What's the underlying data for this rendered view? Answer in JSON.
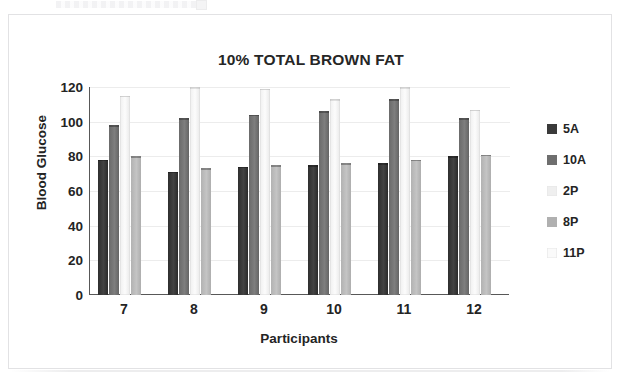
{
  "figure": {
    "title": "10% TOTAL BROWN FAT"
  },
  "axes": {
    "y_title": "Blood Glucose",
    "x_title": "Participants",
    "y_ticks": [
      "120",
      "100",
      "80",
      "60",
      "40",
      "20",
      "0"
    ],
    "x_ticks": [
      "7",
      "8",
      "9",
      "10",
      "11",
      "12"
    ]
  },
  "legend": {
    "items": [
      {
        "label": "5A",
        "color": "#3a3a3a"
      },
      {
        "label": "10A",
        "color": "#6e6e6e"
      },
      {
        "label": "2P",
        "color": "#efefef"
      },
      {
        "label": "8P",
        "color": "#b0b0b0"
      },
      {
        "label": "11P",
        "color": "#fafafa"
      }
    ]
  },
  "chart_data": {
    "type": "bar",
    "title": "10% TOTAL BROWN FAT",
    "xlabel": "Participants",
    "ylabel": "Blood Glucose",
    "ylim": [
      0,
      120
    ],
    "ytick_step": 20,
    "grid": true,
    "legend_position": "right",
    "categories": [
      "7",
      "8",
      "9",
      "10",
      "11",
      "12"
    ],
    "series": [
      {
        "name": "5A",
        "color": "#3a3a3a",
        "values": [
          78,
          71,
          74,
          75,
          76,
          80
        ]
      },
      {
        "name": "10A",
        "color": "#6e6e6e",
        "values": [
          98,
          102,
          104,
          106,
          113,
          102
        ]
      },
      {
        "name": "2P",
        "color": "#efefef",
        "values": [
          115,
          120,
          119,
          113,
          120,
          107
        ]
      },
      {
        "name": "8P",
        "color": "#b0b0b0",
        "values": [
          80,
          73,
          75,
          76,
          78,
          81
        ]
      },
      {
        "name": "11P",
        "color": "#fafafa",
        "values": [
          0,
          0,
          0,
          0,
          0,
          0
        ]
      }
    ]
  }
}
